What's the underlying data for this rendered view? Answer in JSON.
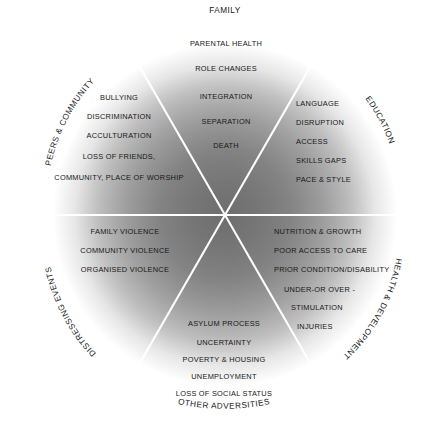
{
  "diagram": {
    "title_top": "FAMILY",
    "title_bottom": "OTHER ADVERSITIES",
    "center_point_label": "child-at-centre",
    "colors": {
      "background": "#ffffff",
      "gradient_centre": "#6f6f6f",
      "gradient_mid": "#9a9a9a",
      "gradient_edge": "#ffffff",
      "divider": "#ffffff",
      "text": "#171717"
    },
    "sectors": [
      {
        "id": "family",
        "label": "FAMILY",
        "label_style": "straight-top",
        "items": [
          "PARENTAL HEALTH",
          "ROLE CHANGES",
          "INTEGRATION",
          "SEPARATION",
          "DEATH"
        ]
      },
      {
        "id": "education",
        "label": "EDUCATION",
        "label_style": "arc-upper-right",
        "items": [
          "LANGUAGE",
          "DISRUPTION",
          "ACCESS",
          "SKILLS GAPS",
          "PACE & STYLE"
        ]
      },
      {
        "id": "health-and-development",
        "label": "HEALTH & DEVELOPMENT",
        "label_style": "arc-lower-right",
        "items": [
          "NUTRITION & GROWTH",
          "POOR ACCESS TO CARE",
          "PRIOR CONDITION/DISABILITY",
          "UNDER-OR OVER -",
          "STIMULATION",
          "INJURIES"
        ]
      },
      {
        "id": "other-adversities",
        "label": "OTHER ADVERSITIES",
        "label_style": "arc-bottom",
        "items": [
          "ASYLUM PROCESS",
          "UNCERTAINTY",
          "POVERTY & HOUSING",
          "UNEMPLOYMENT",
          "LOSS OF SOCIAL STATUS"
        ]
      },
      {
        "id": "distressing-events",
        "label": "DISTRESSING EVENTS",
        "label_style": "arc-lower-left",
        "items": [
          "FAMILY VIOLENCE",
          "COMMUNITY VIOLENCE",
          "ORGANISED VIOLENCE"
        ]
      },
      {
        "id": "peers-and-community",
        "label": "PEERS & COMMUNITY",
        "label_style": "arc-upper-left",
        "items": [
          "BULLYING",
          "DISCRIMINATION",
          "ACCULTURATION",
          "LOSS OF FRIENDS,",
          "COMMUNITY, PLACE OF WORSHIP"
        ]
      }
    ]
  }
}
